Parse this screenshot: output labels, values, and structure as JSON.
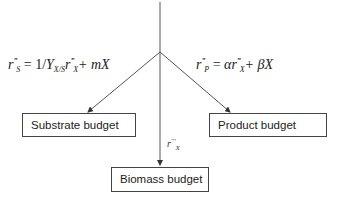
{
  "diagram": {
    "boxes": {
      "substrate": "Substrate budget",
      "product": "Product budget",
      "biomass": "Biomass budget"
    },
    "equations": {
      "substrate": {
        "lhs_symbol": "r",
        "lhs_sub": "S",
        "equals": "=",
        "one_over": "1/",
        "yield_symbol": "Y",
        "yield_sub": "X/S",
        "rate_symbol": "r",
        "rate_sub": "X",
        "plus_term": "+ mX"
      },
      "product": {
        "lhs_symbol": "r",
        "lhs_sub": "P",
        "equals": "=",
        "alpha": "α",
        "rate_symbol": "r",
        "rate_sub": "X",
        "plus_term": "+ βX"
      }
    },
    "edge_labels": {
      "biomass": {
        "symbol": "r",
        "sub": "X"
      }
    },
    "prime_mark": "'''",
    "line_color": "#444444"
  }
}
